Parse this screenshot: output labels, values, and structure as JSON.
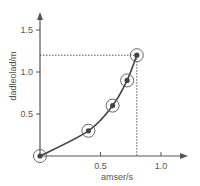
{
  "chart_data": {
    "type": "line",
    "title": "",
    "xlabel": "amser/s",
    "ylabel": "dadleolad/m",
    "xlim": [
      0,
      1.2
    ],
    "ylim": [
      0,
      1.65
    ],
    "x_ticks": [
      0.5,
      1.0
    ],
    "x_tick_labels": [
      "0.5",
      "1.0"
    ],
    "y_ticks": [
      0.5,
      1.0,
      1.5
    ],
    "y_tick_labels": [
      "0.5",
      "1.0",
      "1.5"
    ],
    "grid": false,
    "legend": null,
    "series": [
      {
        "name": "displacement",
        "x": [
          0.0,
          0.4,
          0.6,
          0.72,
          0.8
        ],
        "y": [
          0.0,
          0.3,
          0.6,
          0.9,
          1.2
        ],
        "marker": "circled-dot",
        "color": "#444444"
      }
    ],
    "annotations": [
      {
        "type": "dotted-hline",
        "y": 1.2,
        "x_from": 0,
        "x_to": 0.8
      },
      {
        "type": "dotted-vline",
        "x": 0.8,
        "y_from": 0,
        "y_to": 1.2
      }
    ]
  },
  "colors": {
    "axis": "#555555",
    "line": "#444444",
    "marker_ring": "#666666",
    "background": "#ffffff"
  }
}
